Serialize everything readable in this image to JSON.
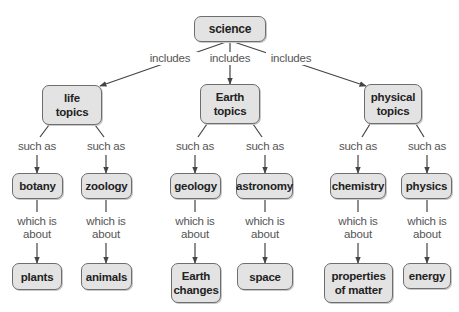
{
  "diagram": {
    "type": "concept-map",
    "colors": {
      "node_fill": "#e3e3e3",
      "node_border": "#6e6e6e",
      "link": "#444444",
      "label_text": "#555555"
    },
    "nodes": {
      "science": "science",
      "life_topics": "life topics",
      "earth_topics": "Earth topics",
      "physical_topics": "physical topics",
      "botany": "botany",
      "zoology": "zoology",
      "geology": "geology",
      "astronomy": "astronomy",
      "chemistry": "chemistry",
      "physics": "physics",
      "plants": "plants",
      "animals": "animals",
      "earth_changes": "Earth changes",
      "space": "space",
      "properties_of_matter": "properties of matter",
      "energy": "energy"
    },
    "link_labels": {
      "includes": "includes",
      "such_as": "such as",
      "which_is_about": "which is about"
    },
    "edges": [
      {
        "from": "science",
        "to": "life_topics",
        "label": "includes"
      },
      {
        "from": "science",
        "to": "earth_topics",
        "label": "includes"
      },
      {
        "from": "science",
        "to": "physical_topics",
        "label": "includes"
      },
      {
        "from": "life_topics",
        "to": "botany",
        "label": "such as"
      },
      {
        "from": "life_topics",
        "to": "zoology",
        "label": "such as"
      },
      {
        "from": "earth_topics",
        "to": "geology",
        "label": "such as"
      },
      {
        "from": "earth_topics",
        "to": "astronomy",
        "label": "such as"
      },
      {
        "from": "physical_topics",
        "to": "chemistry",
        "label": "such as"
      },
      {
        "from": "physical_topics",
        "to": "physics",
        "label": "such as"
      },
      {
        "from": "botany",
        "to": "plants",
        "label": "which is about"
      },
      {
        "from": "zoology",
        "to": "animals",
        "label": "which is about"
      },
      {
        "from": "geology",
        "to": "earth_changes",
        "label": "which is about"
      },
      {
        "from": "astronomy",
        "to": "space",
        "label": "which is about"
      },
      {
        "from": "chemistry",
        "to": "properties_of_matter",
        "label": "which is about"
      },
      {
        "from": "physics",
        "to": "energy",
        "label": "which is about"
      }
    ]
  }
}
